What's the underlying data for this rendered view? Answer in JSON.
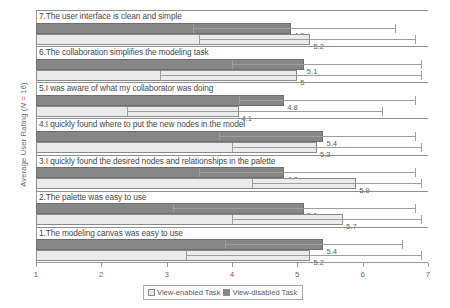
{
  "chart_data": {
    "type": "bar",
    "orientation": "horizontal",
    "title": "",
    "xlabel": "",
    "ylabel": "Average User Rating (N = 16)",
    "ylabel_parts": {
      "pre": "Average User Rating (",
      "italic": "N",
      "post": " = 16)"
    },
    "xlim": [
      1,
      7
    ],
    "xticks": [
      "1",
      "2",
      "3",
      "4",
      "5",
      "6",
      "7"
    ],
    "grid": false,
    "legend_position": "bottom",
    "categories": [
      "7.The user interface is clean and simple",
      "6.The collaboration simplifies the modeling task",
      "5.I was aware of what my collaborator was doing",
      "4.I quickly found where to put the new nodes in the model",
      "3.I quickly found the desired nodes and relationships in the palette",
      "2.The palette was easy to use",
      "1.The modeling canvas was easy to use"
    ],
    "series": [
      {
        "name": "View-disabled Task",
        "color": "#868686",
        "values": [
          4.9,
          5.1,
          4.8,
          5.4,
          4.8,
          5.1,
          5.4
        ],
        "labels": [
          "4.9",
          "5.1",
          "4.8",
          "5.4",
          "4.8",
          "5.1",
          "5.4"
        ],
        "error_high": [
          6.5,
          6.9,
          6.8,
          6.8,
          6.8,
          6.8,
          6.6
        ],
        "error_low": [
          3.4,
          4.0,
          4.1,
          3.8,
          3.5,
          3.1,
          3.9
        ]
      },
      {
        "name": "View-enabled Task",
        "color": "#ebebeb",
        "values": [
          5.2,
          5.0,
          4.1,
          5.3,
          5.9,
          5.7,
          5.2
        ],
        "labels": [
          "5.2",
          "5",
          "4.1",
          "5.3",
          "5.9",
          "5.7",
          "5.2"
        ],
        "error_high": [
          6.8,
          6.9,
          6.3,
          6.9,
          6.9,
          6.9,
          6.9
        ],
        "error_low": [
          3.5,
          2.9,
          2.4,
          4.0,
          4.3,
          4.0,
          3.3
        ]
      }
    ]
  },
  "legend": {
    "items": [
      {
        "label": "View-enabled Task",
        "swatch": "light"
      },
      {
        "label": "View-disabled Task",
        "swatch": "dark"
      }
    ]
  }
}
